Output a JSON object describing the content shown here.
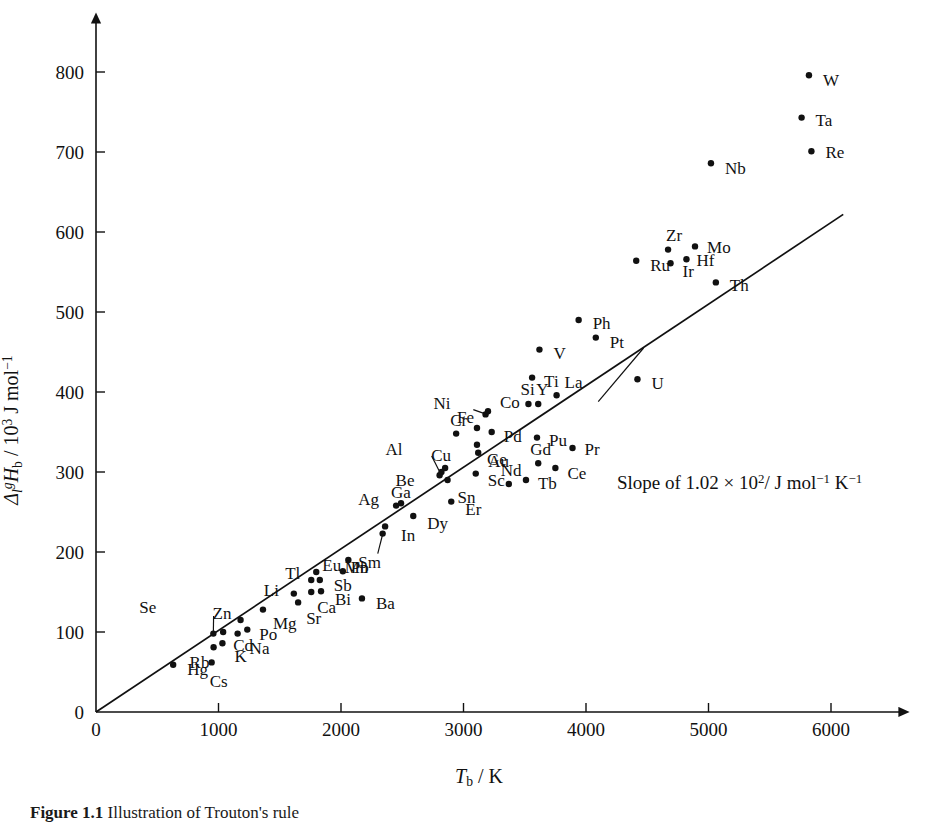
{
  "figure": {
    "caption_number": "Figure 1.1",
    "caption_text": "Illustration of Trouton's rule"
  },
  "annotation": {
    "slope_prefix": "Slope of 1.02",
    "slope_times": "×",
    "slope_base": "10",
    "slope_exp": "2",
    "slope_units_pre": "/ J mol",
    "slope_units_exp1": "−1",
    "slope_units_mid": " K",
    "slope_units_exp2": "−1",
    "slope_full_text": "Slope of 1.02 × 10²/ J mol⁻¹ K⁻¹"
  },
  "chart_data": {
    "type": "scatter",
    "title": "",
    "xlabel": "T_b / K",
    "ylabel": "Δ_l^g H_b / 10³ J mol⁻¹",
    "xlabel_parts": {
      "symbol": "T",
      "sub": "b",
      "sep": " / ",
      "unit": "K"
    },
    "ylabel_parts": {
      "symbol": "Δ",
      "sub": "l",
      "sup": "g",
      "symbol2": "H",
      "sub2": "b",
      "sep": " / 10",
      "sup2": "3",
      "unit": " J mol",
      "unit_sup": "−1"
    },
    "xlim": [
      0,
      6400
    ],
    "ylim": [
      0,
      840
    ],
    "xticks": [
      0,
      1000,
      2000,
      3000,
      4000,
      5000,
      6000
    ],
    "xticklabels": [
      "0",
      "1000",
      "2000",
      "3000",
      "4000",
      "5000",
      "6000"
    ],
    "yticks": [
      0,
      100,
      200,
      300,
      400,
      500,
      600,
      700,
      800
    ],
    "yticklabels": [
      "0",
      "100",
      "200",
      "300",
      "400",
      "500",
      "600",
      "700",
      "800"
    ],
    "grid": false,
    "legend": false,
    "trendline": {
      "x0": 0,
      "y0": 0,
      "x1": 6100,
      "y1": 622,
      "slope": 102
    },
    "points": [
      {
        "label": "Hg",
        "x": 630,
        "y": 59,
        "lx": 14,
        "ly": 5,
        "leader": false
      },
      {
        "label": "Cs",
        "x": 944,
        "y": 62,
        "lx": -2,
        "ly": 20,
        "leader": false
      },
      {
        "label": "Rb",
        "x": 960,
        "y": 81,
        "lx": -24,
        "ly": 16,
        "leader": false
      },
      {
        "label": "K",
        "x": 1032,
        "y": 86,
        "lx": 12,
        "ly": 14,
        "leader": false
      },
      {
        "label": "Se",
        "x": 958,
        "y": 98,
        "lx": -74,
        "ly": -26,
        "leader": true
      },
      {
        "label": "Cd",
        "x": 1038,
        "y": 100,
        "lx": 10,
        "ly": 14,
        "leader": false
      },
      {
        "label": "Na",
        "x": 1156,
        "y": 98,
        "lx": 12,
        "ly": 15,
        "leader": false
      },
      {
        "label": "Po",
        "x": 1235,
        "y": 103,
        "lx": 12,
        "ly": 5,
        "leader": false
      },
      {
        "label": "Zn",
        "x": 1180,
        "y": 115,
        "lx": -28,
        "ly": -6,
        "leader": false
      },
      {
        "label": "Mg",
        "x": 1363,
        "y": 128,
        "lx": 10,
        "ly": 14,
        "leader": false
      },
      {
        "label": "Sr",
        "x": 1650,
        "y": 137,
        "lx": 8,
        "ly": 17,
        "leader": false
      },
      {
        "label": "Li",
        "x": 1615,
        "y": 148,
        "lx": -30,
        "ly": -3,
        "leader": false
      },
      {
        "label": "Ca",
        "x": 1757,
        "y": 150,
        "lx": 6,
        "ly": 16,
        "leader": false
      },
      {
        "label": "Ba",
        "x": 2171,
        "y": 142,
        "lx": 14,
        "ly": 6,
        "leader": false
      },
      {
        "label": "Bi",
        "x": 1837,
        "y": 151,
        "lx": 14,
        "ly": 9,
        "leader": false
      },
      {
        "label": "Sb",
        "x": 1827,
        "y": 165,
        "lx": 14,
        "ly": 6,
        "leader": false
      },
      {
        "label": "Tl",
        "x": 1757,
        "y": 165,
        "lx": -26,
        "ly": -6,
        "leader": false
      },
      {
        "label": "Eu",
        "x": 1798,
        "y": 175,
        "lx": 6,
        "ly": -6,
        "leader": false
      },
      {
        "label": "Pb",
        "x": 2015,
        "y": 176,
        "lx": 8,
        "ly": -3,
        "leader": false
      },
      {
        "label": "Sm",
        "x": 2060,
        "y": 190,
        "lx": 10,
        "ly": 3,
        "leader": false
      },
      {
        "label": "Mn",
        "x": 2340,
        "y": 223,
        "lx": -38,
        "ly": 34,
        "leader": true
      },
      {
        "label": "In",
        "x": 2360,
        "y": 232,
        "lx": 16,
        "ly": 10,
        "leader": false
      },
      {
        "label": "Dy",
        "x": 2590,
        "y": 245,
        "lx": 14,
        "ly": 8,
        "leader": false
      },
      {
        "label": "Ag",
        "x": 2450,
        "y": 258,
        "lx": -38,
        "ly": -6,
        "leader": false
      },
      {
        "label": "Ga",
        "x": 2490,
        "y": 261,
        "lx": -10,
        "ly": -10,
        "leader": false
      },
      {
        "label": "Er",
        "x": 2900,
        "y": 263,
        "lx": 14,
        "ly": 8,
        "leader": false
      },
      {
        "label": "Sn",
        "x": 2870,
        "y": 290,
        "lx": 10,
        "ly": 18,
        "leader": false
      },
      {
        "label": "Be",
        "x": 2805,
        "y": 296,
        "lx": -44,
        "ly": 6,
        "leader": false
      },
      {
        "label": "Al",
        "x": 2820,
        "y": 300,
        "lx": -56,
        "ly": -22,
        "leader": true
      },
      {
        "label": "Cu",
        "x": 2850,
        "y": 305,
        "lx": -14,
        "ly": -12,
        "leader": false
      },
      {
        "label": "Nd",
        "x": 3370,
        "y": 285,
        "lx": -8,
        "ly": -13,
        "leader": false
      },
      {
        "label": "Tb",
        "x": 3510,
        "y": 290,
        "lx": 12,
        "ly": 4,
        "leader": false
      },
      {
        "label": "Sc",
        "x": 3100,
        "y": 298,
        "lx": 12,
        "ly": 7,
        "leader": false
      },
      {
        "label": "Ce",
        "x": 3750,
        "y": 305,
        "lx": 12,
        "ly": 6,
        "leader": false
      },
      {
        "label": "Gd",
        "x": 3610,
        "y": 311,
        "lx": -8,
        "ly": -13,
        "leader": false
      },
      {
        "label": "Au",
        "x": 3120,
        "y": 324,
        "lx": 10,
        "ly": 9,
        "leader": false
      },
      {
        "label": "Pr",
        "x": 3890,
        "y": 330,
        "lx": 12,
        "ly": 2,
        "leader": false
      },
      {
        "label": "Ge",
        "x": 3110,
        "y": 334,
        "lx": 10,
        "ly": 15,
        "leader": false
      },
      {
        "label": "Pu",
        "x": 3600,
        "y": 343,
        "lx": 12,
        "ly": 3,
        "leader": false
      },
      {
        "label": "Pd",
        "x": 3230,
        "y": 350,
        "lx": 12,
        "ly": 5,
        "leader": false
      },
      {
        "label": "Cr",
        "x": 2940,
        "y": 348,
        "lx": -6,
        "ly": -13,
        "leader": false
      },
      {
        "label": "Fe",
        "x": 3110,
        "y": 355,
        "lx": -20,
        "ly": -10,
        "leader": false
      },
      {
        "label": "Ni",
        "x": 3180,
        "y": 372,
        "lx": -52,
        "ly": -10,
        "leader": true
      },
      {
        "label": "Co",
        "x": 3200,
        "y": 376,
        "lx": 12,
        "ly": -8,
        "leader": false
      },
      {
        "label": "Si",
        "x": 3530,
        "y": 385,
        "lx": -8,
        "ly": -14,
        "leader": false
      },
      {
        "label": "Y",
        "x": 3610,
        "y": 385,
        "lx": -2,
        "ly": -14,
        "leader": false
      },
      {
        "label": "La",
        "x": 3760,
        "y": 396,
        "lx": 8,
        "ly": -12,
        "leader": false
      },
      {
        "label": "Ti",
        "x": 3560,
        "y": 418,
        "lx": 12,
        "ly": 4,
        "leader": false
      },
      {
        "label": "U",
        "x": 4420,
        "y": 416,
        "lx": 14,
        "ly": 5,
        "leader": false
      },
      {
        "label": "V",
        "x": 3620,
        "y": 453,
        "lx": 14,
        "ly": 4,
        "leader": false
      },
      {
        "label": "Pt",
        "x": 4080,
        "y": 468,
        "lx": 14,
        "ly": 5,
        "leader": false
      },
      {
        "label": "Ph",
        "x": 3940,
        "y": 490,
        "lx": 14,
        "ly": 4,
        "leader": false
      },
      {
        "label": "Th",
        "x": 5060,
        "y": 537,
        "lx": 14,
        "ly": 4,
        "leader": false
      },
      {
        "label": "Ru",
        "x": 4410,
        "y": 564,
        "lx": 14,
        "ly": 5,
        "leader": false
      },
      {
        "label": "Ir",
        "x": 4690,
        "y": 561,
        "lx": 12,
        "ly": 9,
        "leader": false
      },
      {
        "label": "Hf",
        "x": 4820,
        "y": 566,
        "lx": 10,
        "ly": 2,
        "leader": false
      },
      {
        "label": "Zr",
        "x": 4670,
        "y": 578,
        "lx": -2,
        "ly": -14,
        "leader": false
      },
      {
        "label": "Mo",
        "x": 4890,
        "y": 582,
        "lx": 12,
        "ly": 2,
        "leader": false
      },
      {
        "label": "Nb",
        "x": 5020,
        "y": 686,
        "lx": 14,
        "ly": 6,
        "leader": false
      },
      {
        "label": "Re",
        "x": 5840,
        "y": 701,
        "lx": 14,
        "ly": 2,
        "leader": false
      },
      {
        "label": "Ta",
        "x": 5760,
        "y": 743,
        "lx": 14,
        "ly": 3,
        "leader": false
      },
      {
        "label": "W",
        "x": 5820,
        "y": 796,
        "lx": 14,
        "ly": 6,
        "leader": false
      }
    ],
    "leaders": [
      {
        "label": "Se",
        "x1": 960,
        "y1": 120,
        "x2": 958,
        "y2": 100
      },
      {
        "label": "Mn",
        "x1": 2300,
        "y1": 198,
        "x2": 2338,
        "y2": 221
      },
      {
        "label": "Al",
        "x1": 2740,
        "y1": 320,
        "x2": 2800,
        "y2": 302
      },
      {
        "label": "Ni",
        "x1": 3080,
        "y1": 378,
        "x2": 3172,
        "y2": 373
      },
      {
        "label": "slope-pointer",
        "x1": 4470,
        "y1": 455,
        "x2": 4100,
        "y2": 388
      }
    ]
  }
}
